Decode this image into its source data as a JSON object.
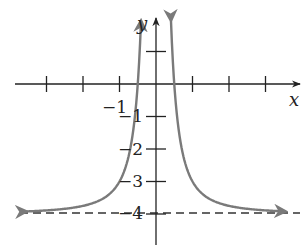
{
  "chart_data": {
    "type": "line",
    "title": "",
    "xlabel": "x",
    "ylabel": "y",
    "function": "y = 1/x^2 - 4",
    "xlim": [
      -3.5,
      4
    ],
    "ylim": [
      -5,
      2
    ],
    "x_ticks": [
      -3,
      -2,
      -1,
      1,
      2,
      3
    ],
    "y_ticks": [
      1,
      -1,
      -2,
      -3,
      -4
    ],
    "x_tick_labels": [
      {
        "value": -1,
        "label": "−1"
      }
    ],
    "y_tick_labels": [
      {
        "value": -1,
        "label": "−1"
      },
      {
        "value": -2,
        "label": "−2"
      },
      {
        "value": -3,
        "label": "−3"
      },
      {
        "value": -4,
        "label": "−4"
      }
    ],
    "asymptotes": [
      {
        "type": "horizontal",
        "y": -4,
        "style": "dashed"
      },
      {
        "type": "vertical",
        "x": 0
      }
    ],
    "series": [
      {
        "name": "left branch",
        "x": [
          -3.5,
          -3,
          -2,
          -1.5,
          -1,
          -0.75,
          -0.5,
          -0.4
        ],
        "y": [
          -3.92,
          -3.89,
          -3.75,
          -3.56,
          -3,
          -2.22,
          0,
          2.25
        ]
      },
      {
        "name": "right branch",
        "x": [
          0.4,
          0.5,
          0.75,
          1,
          1.5,
          2,
          3,
          3.5
        ],
        "y": [
          2.25,
          0,
          -2.22,
          -3,
          -3.56,
          -3.75,
          -3.89,
          -3.92
        ]
      }
    ],
    "curve_color": "#7a7a7a",
    "axis_color": "#222222",
    "grid": false
  }
}
